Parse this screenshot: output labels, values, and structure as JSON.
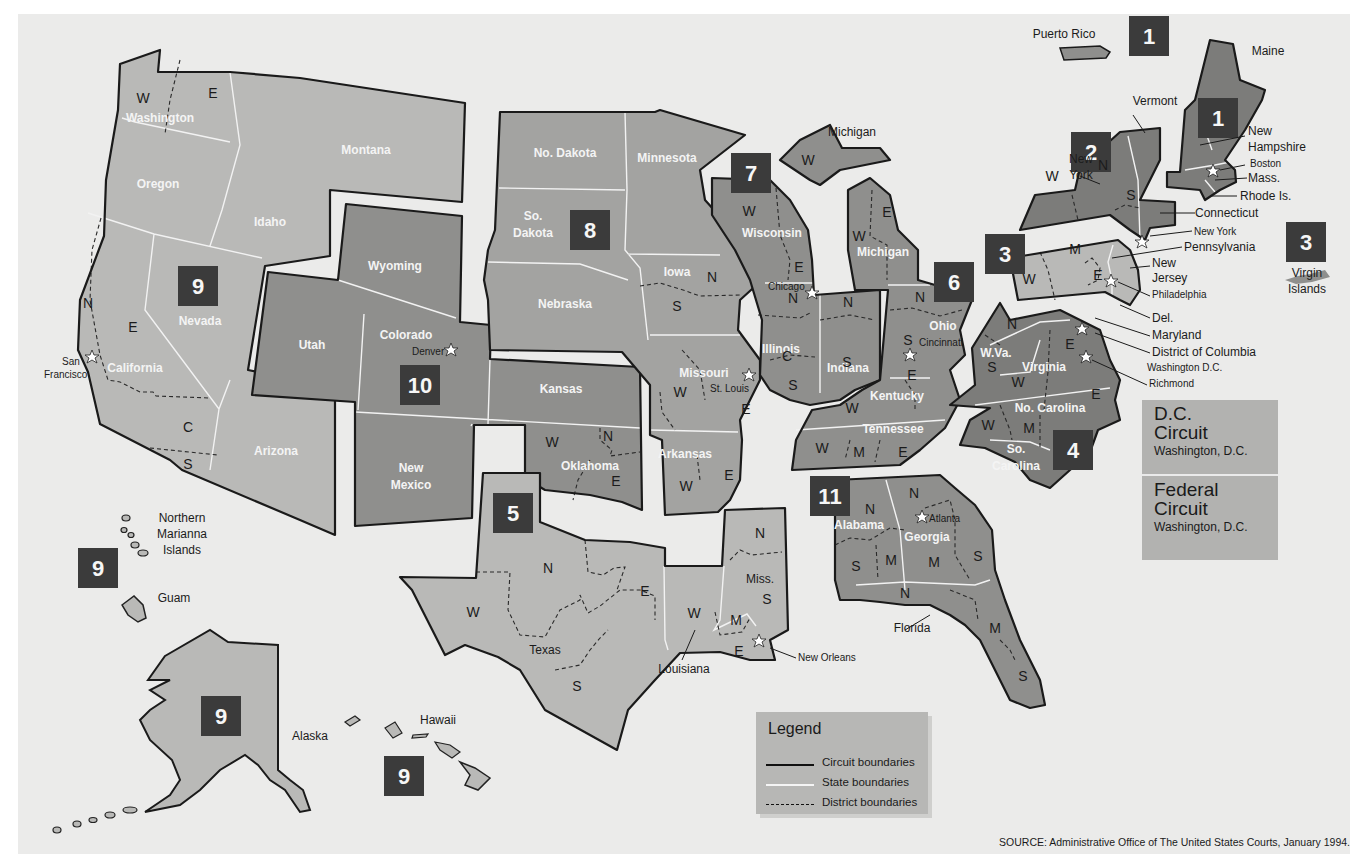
{
  "colors": {
    "background": "#ebebea",
    "circuit_badge": "#3b3b3b",
    "light_region": "#b9b9b7",
    "mid_region": "#a3a3a1",
    "dark_region": "#8f8f8d",
    "darker_region": "#7c7c7a"
  },
  "circuit_badges": [
    {
      "id": "1",
      "x": 1130,
      "y": 18,
      "note": "Puerto Rico"
    },
    {
      "id": "1",
      "x": 1205,
      "y": 100,
      "note": "Maine"
    },
    {
      "id": "2",
      "x": 1071,
      "y": 133
    },
    {
      "id": "3",
      "x": 985,
      "y": 235
    },
    {
      "id": "3",
      "x": 1286,
      "y": 224,
      "note": "Virgin Islands"
    },
    {
      "id": "4",
      "x": 1053,
      "y": 429
    },
    {
      "id": "5",
      "x": 493,
      "y": 495
    },
    {
      "id": "6",
      "x": 935,
      "y": 263
    },
    {
      "id": "7",
      "x": 732,
      "y": 152
    },
    {
      "id": "8",
      "x": 570,
      "y": 210
    },
    {
      "id": "9",
      "x": 178,
      "y": 265
    },
    {
      "id": "9",
      "x": 80,
      "y": 549,
      "note": "Guam / N. Mariana"
    },
    {
      "id": "9",
      "x": 202,
      "y": 697,
      "note": "Alaska"
    },
    {
      "id": "9",
      "x": 385,
      "y": 757,
      "note": "Hawaii"
    },
    {
      "id": "10",
      "x": 401,
      "y": 366
    },
    {
      "id": "11",
      "x": 810,
      "y": 478
    }
  ],
  "state_labels": [
    {
      "text": "Washington",
      "x": 160,
      "y": 122
    },
    {
      "text": "Oregon",
      "x": 158,
      "y": 188
    },
    {
      "text": "Montana",
      "x": 366,
      "y": 154
    },
    {
      "text": "Idaho",
      "x": 270,
      "y": 226
    },
    {
      "text": "Nevada",
      "x": 200,
      "y": 325
    },
    {
      "text": "California",
      "x": 135,
      "y": 372
    },
    {
      "text": "Arizona",
      "x": 276,
      "y": 455
    },
    {
      "text": "Wyoming",
      "x": 395,
      "y": 270
    },
    {
      "text": "Utah",
      "x": 312,
      "y": 349
    },
    {
      "text": "Colorado",
      "x": 406,
      "y": 339
    },
    {
      "text": "New",
      "x": 411,
      "y": 472
    },
    {
      "text": "Mexico",
      "x": 411,
      "y": 489
    },
    {
      "text": "Kansas",
      "x": 561,
      "y": 393
    },
    {
      "text": "Oklahoma",
      "x": 590,
      "y": 470
    },
    {
      "text": "No. Dakota",
      "x": 565,
      "y": 157
    },
    {
      "text": "Minnesota",
      "x": 667,
      "y": 162
    },
    {
      "text": "So.",
      "x": 533,
      "y": 220
    },
    {
      "text": "Dakota",
      "x": 533,
      "y": 237
    },
    {
      "text": "Nebraska",
      "x": 565,
      "y": 308
    },
    {
      "text": "Iowa",
      "x": 677,
      "y": 276
    },
    {
      "text": "Missouri",
      "x": 704,
      "y": 377
    },
    {
      "text": "Arkansas",
      "x": 685,
      "y": 458
    },
    {
      "text": "Wisconsin",
      "x": 772,
      "y": 237
    },
    {
      "text": "Michigan",
      "x": 883,
      "y": 256
    },
    {
      "text": "Illinois",
      "x": 781,
      "y": 353
    },
    {
      "text": "Indiana",
      "x": 848,
      "y": 372
    },
    {
      "text": "Ohio",
      "x": 943,
      "y": 330
    },
    {
      "text": "Kentucky",
      "x": 897,
      "y": 400
    },
    {
      "text": "Tennessee",
      "x": 893,
      "y": 433
    },
    {
      "text": "W.Va.",
      "x": 996,
      "y": 357
    },
    {
      "text": "Virginia",
      "x": 1044,
      "y": 371
    },
    {
      "text": "No. Carolina",
      "x": 1050,
      "y": 412
    },
    {
      "text": "So.",
      "x": 1016,
      "y": 453
    },
    {
      "text": "Carolina",
      "x": 1016,
      "y": 470
    },
    {
      "text": "Alabama",
      "x": 859,
      "y": 529
    },
    {
      "text": "Georgia",
      "x": 927,
      "y": 541
    }
  ],
  "dark_labels": [
    {
      "text": "Texas",
      "x": 545,
      "y": 654
    },
    {
      "text": "Louisiana",
      "x": 684,
      "y": 673
    },
    {
      "text": "Miss.",
      "x": 760,
      "y": 583
    },
    {
      "text": "Florida",
      "x": 912,
      "y": 632
    },
    {
      "text": "Michigan",
      "x": 852,
      "y": 136
    },
    {
      "text": "Maine",
      "x": 1268,
      "y": 55
    },
    {
      "text": "Vermont",
      "x": 1155,
      "y": 105
    },
    {
      "text": "New",
      "x": 1081,
      "y": 163
    },
    {
      "text": "York",
      "x": 1081,
      "y": 179
    },
    {
      "text": "New",
      "x": 1248,
      "y": 135
    },
    {
      "text": "Hampshire",
      "x": 1268,
      "y": 151
    },
    {
      "text": "Mass.",
      "x": 1268,
      "y": 180
    },
    {
      "text": "Rhode Is.",
      "x": 1260,
      "y": 199
    },
    {
      "text": "Connecticut",
      "x": 1237,
      "y": 216
    },
    {
      "text": "Pennsylvania",
      "x": 1226,
      "y": 249
    },
    {
      "text": "New",
      "x": 1152,
      "y": 266
    },
    {
      "text": "Jersey",
      "x": 1152,
      "y": 281
    },
    {
      "text": "Del.",
      "x": 1152,
      "y": 321
    },
    {
      "text": "Maryland",
      "x": 1152,
      "y": 339
    },
    {
      "text": "District of Columbia",
      "x": 1152,
      "y": 356
    },
    {
      "text": "Puerto Rico",
      "x": 1046,
      "y": 38
    },
    {
      "text": "Virgin",
      "x": 1307,
      "y": 277
    },
    {
      "text": "Islands",
      "x": 1307,
      "y": 293
    },
    {
      "text": "Northern",
      "x": 182,
      "y": 522
    },
    {
      "text": "Marianna",
      "x": 182,
      "y": 538
    },
    {
      "text": "Islands",
      "x": 182,
      "y": 554
    },
    {
      "text": "Guam",
      "x": 174,
      "y": 602
    },
    {
      "text": "Alaska",
      "x": 310,
      "y": 740
    },
    {
      "text": "Hawaii",
      "x": 438,
      "y": 724
    }
  ],
  "city_labels": [
    {
      "text": "San",
      "x": 78,
      "y": 365,
      "star_x": 92,
      "star_y": 357
    },
    {
      "text": "Francisco",
      "x": 62,
      "y": 378
    },
    {
      "text": "Denver",
      "x": 415,
      "y": 355,
      "star_x": 451,
      "star_y": 350
    },
    {
      "text": "Chicago",
      "x": 768,
      "y": 290,
      "star_x": 812,
      "star_y": 293
    },
    {
      "text": "St. Louis",
      "x": 710,
      "y": 392,
      "star_x": 749,
      "star_y": 375
    },
    {
      "text": "Cincinnati",
      "x": 917,
      "y": 346,
      "star_x": 910,
      "star_y": 355
    },
    {
      "text": "Atlanta",
      "x": 927,
      "y": 521,
      "star_x": 922,
      "star_y": 517
    },
    {
      "text": "New Orleans",
      "x": 798,
      "y": 661,
      "star_x": 759,
      "star_y": 641
    },
    {
      "text": "Boston",
      "x": 1252,
      "y": 167,
      "star_x": 1213,
      "star_y": 171
    },
    {
      "text": "New York",
      "x": 1194,
      "y": 235,
      "star_x": 1142,
      "star_y": 242
    },
    {
      "text": "Philadelphia",
      "x": 1152,
      "y": 298,
      "star_x": 1111,
      "star_y": 281
    },
    {
      "text": "Washington D.C.",
      "x": 1147,
      "y": 371,
      "star_x": 1082,
      "star_y": 329
    },
    {
      "text": "Richmond",
      "x": 1149,
      "y": 387,
      "star_x": 1086,
      "star_y": 357
    }
  ],
  "district_labels": [
    {
      "text": "W",
      "x": 143,
      "y": 103
    },
    {
      "text": "E",
      "x": 213,
      "y": 98
    },
    {
      "text": "N",
      "x": 88,
      "y": 308
    },
    {
      "text": "E",
      "x": 133,
      "y": 332
    },
    {
      "text": "C",
      "x": 188,
      "y": 432
    },
    {
      "text": "S",
      "x": 188,
      "y": 469
    },
    {
      "text": "W",
      "x": 552,
      "y": 447
    },
    {
      "text": "N",
      "x": 608,
      "y": 441
    },
    {
      "text": "E",
      "x": 616,
      "y": 486
    },
    {
      "text": "N",
      "x": 712,
      "y": 282
    },
    {
      "text": "S",
      "x": 677,
      "y": 311
    },
    {
      "text": "W",
      "x": 680,
      "y": 397
    },
    {
      "text": "E",
      "x": 746,
      "y": 414
    },
    {
      "text": "E",
      "x": 729,
      "y": 480
    },
    {
      "text": "W",
      "x": 686,
      "y": 491
    },
    {
      "text": "W",
      "x": 749,
      "y": 216
    },
    {
      "text": "E",
      "x": 799,
      "y": 272
    },
    {
      "text": "W",
      "x": 808,
      "y": 165
    },
    {
      "text": "N",
      "x": 793,
      "y": 303
    },
    {
      "text": "C",
      "x": 787,
      "y": 361
    },
    {
      "text": "S",
      "x": 793,
      "y": 390
    },
    {
      "text": "N",
      "x": 848,
      "y": 307
    },
    {
      "text": "S",
      "x": 847,
      "y": 367
    },
    {
      "text": "E",
      "x": 887,
      "y": 217
    },
    {
      "text": "W",
      "x": 859,
      "y": 241
    },
    {
      "text": "N",
      "x": 920,
      "y": 302
    },
    {
      "text": "S",
      "x": 908,
      "y": 345
    },
    {
      "text": "E",
      "x": 912,
      "y": 380
    },
    {
      "text": "W",
      "x": 852,
      "y": 413
    },
    {
      "text": "W",
      "x": 822,
      "y": 453
    },
    {
      "text": "M",
      "x": 859,
      "y": 457
    },
    {
      "text": "E",
      "x": 903,
      "y": 457
    },
    {
      "text": "N",
      "x": 1012,
      "y": 329
    },
    {
      "text": "S",
      "x": 992,
      "y": 372
    },
    {
      "text": "E",
      "x": 1070,
      "y": 349
    },
    {
      "text": "W",
      "x": 1018,
      "y": 387
    },
    {
      "text": "E",
      "x": 1096,
      "y": 399
    },
    {
      "text": "W",
      "x": 988,
      "y": 430
    },
    {
      "text": "M",
      "x": 1029,
      "y": 433
    },
    {
      "text": "W",
      "x": 1052,
      "y": 181
    },
    {
      "text": "N",
      "x": 1103,
      "y": 170
    },
    {
      "text": "S",
      "x": 1131,
      "y": 200
    },
    {
      "text": "M",
      "x": 1075,
      "y": 254
    },
    {
      "text": "W",
      "x": 1029,
      "y": 284
    },
    {
      "text": "E",
      "x": 1098,
      "y": 280
    },
    {
      "text": "N",
      "x": 870,
      "y": 514
    },
    {
      "text": "S",
      "x": 856,
      "y": 571
    },
    {
      "text": "M",
      "x": 891,
      "y": 565
    },
    {
      "text": "N",
      "x": 914,
      "y": 498
    },
    {
      "text": "M",
      "x": 934,
      "y": 567
    },
    {
      "text": "S",
      "x": 978,
      "y": 561
    },
    {
      "text": "N",
      "x": 905,
      "y": 598
    },
    {
      "text": "M",
      "x": 995,
      "y": 633
    },
    {
      "text": "S",
      "x": 1023,
      "y": 681
    },
    {
      "text": "N",
      "x": 548,
      "y": 573
    },
    {
      "text": "W",
      "x": 473,
      "y": 617
    },
    {
      "text": "E",
      "x": 645,
      "y": 596
    },
    {
      "text": "S",
      "x": 577,
      "y": 691
    },
    {
      "text": "N",
      "x": 760,
      "y": 538
    },
    {
      "text": "S",
      "x": 767,
      "y": 604
    },
    {
      "text": "M",
      "x": 736,
      "y": 625
    },
    {
      "text": "E",
      "x": 739,
      "y": 656
    },
    {
      "text": "W",
      "x": 694,
      "y": 618
    }
  ],
  "dc_box": {
    "dc_circuit": {
      "title_line1": "D.C.",
      "title_line2": "Circuit",
      "location": "Washington, D.C."
    },
    "federal_circuit": {
      "title_line1": "Federal",
      "title_line2": "Circuit",
      "location": "Washington, D.C."
    }
  },
  "legend": {
    "title": "Legend",
    "items": [
      {
        "label": "Circuit boundaries",
        "style": "solid-black"
      },
      {
        "label": "State boundaries",
        "style": "solid-white"
      },
      {
        "label": "District boundaries",
        "style": "dashed-black"
      }
    ]
  },
  "source": "SOURCE: Administrative Office of The United States Courts, January 1994."
}
